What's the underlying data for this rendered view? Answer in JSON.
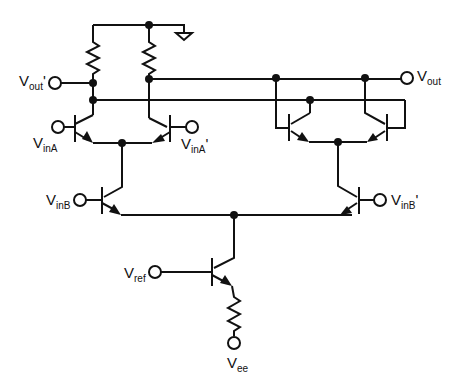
{
  "diagram": {
    "type": "circuit-schematic",
    "labels": {
      "vout_prime": {
        "base": "V",
        "sub": "out",
        "sup": "'"
      },
      "vout": {
        "base": "V",
        "sub": "out",
        "sup": ""
      },
      "vinA": {
        "base": "V",
        "sub": "inA",
        "sup": ""
      },
      "vinA_prime": {
        "base": "V",
        "sub": "inA",
        "sup": "'"
      },
      "vinB": {
        "base": "V",
        "sub": "inB",
        "sup": ""
      },
      "vinB_prime": {
        "base": "V",
        "sub": "inB",
        "sup": "'"
      },
      "vref": {
        "base": "V",
        "sub": "ref",
        "sup": ""
      },
      "vee": {
        "base": "V",
        "sub": "ee",
        "sup": ""
      }
    },
    "components": [
      "R1",
      "R2",
      "R3",
      "Q1",
      "Q2",
      "Q3",
      "Q4",
      "Q5",
      "Q6",
      "Q7",
      "ground"
    ]
  }
}
